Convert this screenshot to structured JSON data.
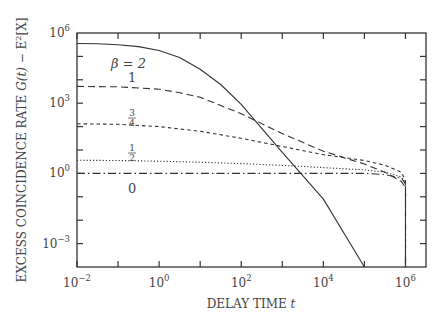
{
  "chart_data": {
    "type": "line",
    "title": "",
    "xlabel": "DELAY TIME t",
    "ylabel": "EXCESS COINCIDENCE RATE G(t) − E²[X]",
    "xscale": "log",
    "yscale": "log",
    "xlim_log10": [
      -2,
      6.5
    ],
    "ylim_log10": [
      -4,
      6
    ],
    "grid": false,
    "legend": "inline curve labels",
    "x_ticks": [
      "10^-2",
      "10^0",
      "10^2",
      "10^4",
      "10^6"
    ],
    "y_ticks": [
      "10^-3",
      "10^0",
      "10^3",
      "10^6"
    ],
    "series": [
      {
        "name": "β = 2",
        "style": "solid",
        "log10_t": [
          -2,
          -1.5,
          -1,
          -0.5,
          0,
          0.5,
          1,
          1.5,
          2,
          3,
          4,
          5
        ],
        "log10_G": [
          5.55,
          5.54,
          5.5,
          5.42,
          5.25,
          4.95,
          4.45,
          3.8,
          2.95,
          0.9,
          -1.1,
          -4
        ]
      },
      {
        "name": "β = 1",
        "style": "dashed",
        "log10_t": [
          -2,
          -1,
          0,
          0.5,
          1,
          2,
          3,
          4,
          5,
          5.5,
          5.9,
          6,
          6,
          6
        ],
        "log10_G": [
          3.72,
          3.7,
          3.6,
          3.45,
          3.25,
          2.55,
          1.7,
          0.95,
          0.4,
          0.05,
          -0.35,
          -0.6,
          -2,
          -4
        ]
      },
      {
        "name": "β = 3/4",
        "style": "short-dashed",
        "log10_t": [
          -2,
          -1,
          0,
          1,
          2,
          3,
          4,
          5,
          5.5,
          5.9,
          6,
          6,
          6
        ],
        "log10_G": [
          2.12,
          2.1,
          2.0,
          1.8,
          1.5,
          1.15,
          0.8,
          0.55,
          0.35,
          0.05,
          -0.3,
          -2,
          -4
        ]
      },
      {
        "name": "β = 1/2",
        "style": "dotted",
        "log10_t": [
          -2,
          -1,
          0,
          1,
          2,
          3,
          4,
          5,
          5.5,
          5.9,
          6,
          6,
          6
        ],
        "log10_G": [
          0.56,
          0.55,
          0.52,
          0.48,
          0.42,
          0.34,
          0.25,
          0.15,
          0.05,
          -0.15,
          -0.4,
          -2,
          -4
        ]
      },
      {
        "name": "β = 0",
        "style": "dash-dot",
        "log10_t": [
          -2,
          0,
          2,
          4,
          5,
          5.5,
          5.9,
          6,
          6,
          6
        ],
        "log10_G": [
          0,
          0,
          0,
          0,
          0,
          -0.05,
          -0.2,
          -0.45,
          -2,
          -4
        ]
      }
    ],
    "annotations": [
      {
        "text": "β = 2",
        "near_log10_t": -0.7,
        "near_log10_G": 4.8
      },
      {
        "text": "1",
        "near_log10_t": -0.6,
        "near_log10_G": 4.15
      },
      {
        "text": "3/4",
        "near_log10_t": -0.6,
        "near_log10_G": 2.4
      },
      {
        "text": "1/2",
        "near_log10_t": -0.6,
        "near_log10_G": 0.85
      },
      {
        "text": "0",
        "near_log10_t": -0.6,
        "near_log10_G": -0.5
      }
    ]
  },
  "axes": {
    "x_title_main": "DELAY TIME ",
    "x_title_var": "t",
    "y_title_main": "EXCESS COINCIDENCE RATE ",
    "y_title_var": "G(t)",
    "y_title_rest": " − E",
    "y_title_sup": "2",
    "y_title_end": "[X]",
    "x_tick_labels": [
      {
        "base": "10",
        "exp": "−2",
        "log": -2
      },
      {
        "base": "10",
        "exp": "0",
        "log": 0
      },
      {
        "base": "10",
        "exp": "2",
        "log": 2
      },
      {
        "base": "10",
        "exp": "4",
        "log": 4
      },
      {
        "base": "10",
        "exp": "6",
        "log": 6
      }
    ],
    "y_tick_labels": [
      {
        "base": "10",
        "exp": "6",
        "log": 6
      },
      {
        "base": "10",
        "exp": "3",
        "log": 3
      },
      {
        "base": "10",
        "exp": "0",
        "log": 0
      },
      {
        "base": "10",
        "exp": "−3",
        "log": -3
      }
    ]
  },
  "labels": {
    "beta2": "β = 2",
    "beta1": "1",
    "beta34_num": "3",
    "beta34_den": "4",
    "beta12_num": "1",
    "beta12_den": "2",
    "beta0": "0"
  }
}
